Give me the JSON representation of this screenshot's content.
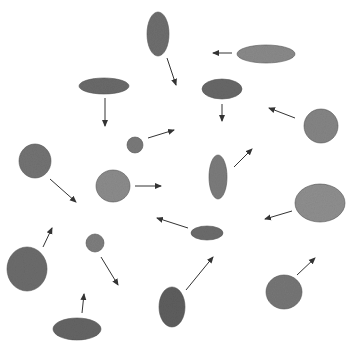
{
  "diagram": {
    "width": 355,
    "height": 348,
    "background": "#ffffff",
    "arrow_color": "#333333",
    "shapes": [
      {
        "id": "blob-1",
        "cx": 158,
        "cy": 34,
        "rx": 11,
        "ry": 22,
        "fill": "#6e6e6e",
        "arrow": [
          167,
          58,
          176,
          85
        ]
      },
      {
        "id": "blob-2",
        "cx": 266,
        "cy": 54,
        "rx": 29,
        "ry": 9,
        "fill": "#8a8a8a",
        "arrow": [
          232,
          53,
          213,
          53
        ]
      },
      {
        "id": "blob-3",
        "cx": 104,
        "cy": 86,
        "rx": 25,
        "ry": 8,
        "fill": "#6a6a6a",
        "arrow": [
          105,
          98,
          105,
          126
        ]
      },
      {
        "id": "blob-4",
        "cx": 222,
        "cy": 89,
        "rx": 20,
        "ry": 10,
        "fill": "#686868",
        "arrow": [
          222,
          104,
          222,
          121
        ]
      },
      {
        "id": "blob-5",
        "cx": 135,
        "cy": 145,
        "rx": 8,
        "ry": 8,
        "fill": "#7a7a7a",
        "arrow": [
          148,
          138,
          174,
          130
        ]
      },
      {
        "id": "blob-6",
        "cx": 321,
        "cy": 126,
        "rx": 17,
        "ry": 17,
        "fill": "#858585",
        "arrow": [
          295,
          118,
          269,
          108
        ]
      },
      {
        "id": "blob-7",
        "cx": 35,
        "cy": 161,
        "rx": 16,
        "ry": 17,
        "fill": "#737373",
        "arrow": [
          50,
          179,
          76,
          202
        ]
      },
      {
        "id": "blob-8",
        "cx": 113,
        "cy": 186,
        "rx": 17,
        "ry": 16,
        "fill": "#8c8c8c",
        "arrow": [
          135,
          186,
          161,
          186
        ]
      },
      {
        "id": "blob-9",
        "cx": 218,
        "cy": 177,
        "rx": 9,
        "ry": 22,
        "fill": "#7c7c7c",
        "arrow": [
          234,
          167,
          252,
          149
        ]
      },
      {
        "id": "blob-10",
        "cx": 320,
        "cy": 203,
        "rx": 25,
        "ry": 19,
        "fill": "#8f8f8f",
        "arrow": [
          292,
          211,
          265,
          219
        ]
      },
      {
        "id": "blob-11",
        "cx": 207,
        "cy": 233,
        "rx": 16,
        "ry": 7,
        "fill": "#6c6c6c",
        "arrow": [
          188,
          228,
          157,
          218
        ]
      },
      {
        "id": "blob-12",
        "cx": 95,
        "cy": 243,
        "rx": 9,
        "ry": 9,
        "fill": "#7e7e7e",
        "arrow": [
          101,
          257,
          118,
          285
        ]
      },
      {
        "id": "blob-13",
        "cx": 27,
        "cy": 269,
        "rx": 20,
        "ry": 22,
        "fill": "#6c6c6c",
        "arrow": [
          43,
          247,
          52,
          228
        ]
      },
      {
        "id": "blob-14",
        "cx": 172,
        "cy": 307,
        "rx": 13,
        "ry": 20,
        "fill": "#5e5e5e",
        "arrow": [
          186,
          290,
          213,
          257
        ]
      },
      {
        "id": "blob-15",
        "cx": 284,
        "cy": 292,
        "rx": 18,
        "ry": 17,
        "fill": "#767676",
        "arrow": [
          297,
          275,
          315,
          258
        ]
      },
      {
        "id": "blob-16",
        "cx": 77,
        "cy": 329,
        "rx": 24,
        "ry": 11,
        "fill": "#656565",
        "arrow": [
          82,
          313,
          84,
          294
        ]
      }
    ]
  }
}
